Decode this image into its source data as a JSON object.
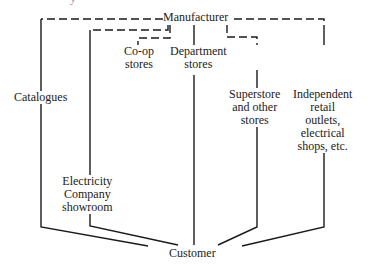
{
  "diagram": {
    "type": "distribution-channels",
    "top_fragment": "y",
    "source_node": "Manufacturer",
    "target_node": "Customer",
    "channels": [
      {
        "label": "Catalogues",
        "link_from_manufacturer": "dashed"
      },
      {
        "label": "Electricity Company showroom",
        "link_from_manufacturer": "dashed"
      },
      {
        "label": "Co-op stores",
        "link_from_manufacturer": "dashed"
      },
      {
        "label": "Department stores",
        "link_from_manufacturer": "solid"
      },
      {
        "label": "Superstore and other stores",
        "link_from_manufacturer": "dashed"
      },
      {
        "label": "Independent retail outlets, electrical shops, etc.",
        "link_from_manufacturer": "dashed"
      }
    ],
    "labels": {
      "manufacturer": "Manufacturer",
      "customer": "Customer",
      "catalogues": "Catalogues",
      "coop_1": "Co-op",
      "coop_2": "stores",
      "dept_1": "Department",
      "dept_2": "stores",
      "super_1": "Superstore",
      "super_2": "and other",
      "super_3": "stores",
      "indep_1": "Independent",
      "indep_2": "retail",
      "indep_3": "outlets,",
      "indep_4": "electrical",
      "indep_5": "shops, etc.",
      "elec_1": "Electricity",
      "elec_2": "Company",
      "elec_3": "showroom"
    },
    "colors": {
      "line": "#1a1a1a",
      "background": "#ffffff"
    }
  }
}
